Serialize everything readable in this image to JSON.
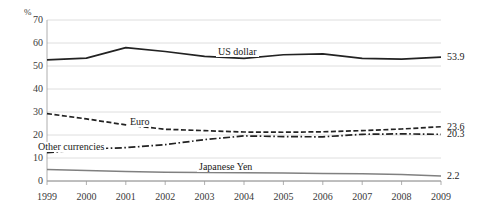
{
  "chart_data": {
    "type": "line",
    "title": "",
    "xlabel": "",
    "ylabel": "%",
    "unit_label": "%",
    "x": [
      1999,
      2000,
      2001,
      2002,
      2003,
      2004,
      2005,
      2006,
      2007,
      2008,
      2009
    ],
    "categories": [
      "1999",
      "2000",
      "2001",
      "2002",
      "2003",
      "2004",
      "2005",
      "2006",
      "2007",
      "2008",
      "2009"
    ],
    "ylim": [
      0,
      70
    ],
    "y_ticks": [
      0,
      10,
      20,
      30,
      40,
      50,
      60,
      70
    ],
    "y_tick_labels": [
      "0",
      "10",
      "20",
      "30",
      "40",
      "50",
      "60",
      "70"
    ],
    "grid": true,
    "legend_position": "inline-annotations",
    "series": [
      {
        "name": "US dollar",
        "label": "US dollar",
        "style": "solid",
        "color": "#222222",
        "values": [
          52.7,
          53.4,
          58.0,
          56.3,
          54.2,
          53.3,
          54.9,
          55.3,
          53.3,
          53.0,
          53.9
        ],
        "end_value": 53.9,
        "end_label": "53.9"
      },
      {
        "name": "Euro",
        "label": "Euro",
        "style": "dashed",
        "color": "#222222",
        "values": [
          29.3,
          27.0,
          24.4,
          22.5,
          21.9,
          21.3,
          21.2,
          21.4,
          21.9,
          22.6,
          23.6
        ],
        "end_value": 23.6,
        "end_label": "23.6"
      },
      {
        "name": "Other currencies",
        "label": "Other currencies",
        "style": "dash-dot",
        "color": "#222222",
        "values": [
          12.3,
          13.9,
          14.5,
          15.8,
          18.0,
          19.6,
          19.3,
          19.2,
          20.3,
          20.5,
          20.3
        ],
        "end_value": 20.3,
        "end_label": "20.3"
      },
      {
        "name": "Japanese Yen",
        "label": "Japanese Yen",
        "style": "solid",
        "color": "#808080",
        "values": [
          5.0,
          4.6,
          4.1,
          3.8,
          3.7,
          3.6,
          3.5,
          3.3,
          3.1,
          2.8,
          2.2
        ],
        "end_value": 2.2,
        "end_label": "2.2"
      }
    ]
  },
  "labels": {
    "unit": "%",
    "us_dollar": "US dollar",
    "euro": "Euro",
    "other_currencies": "Other currencies",
    "japanese_yen": "Japanese Yen",
    "end_us_dollar": "53.9",
    "end_euro": "23.6",
    "end_other": "20.3",
    "end_yen": "2.2"
  }
}
